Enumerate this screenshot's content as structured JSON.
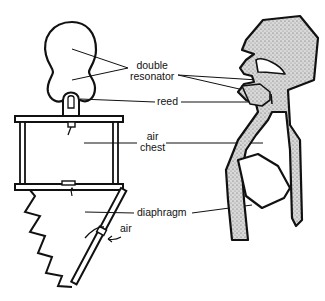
{
  "diagram": {
    "type": "comparison-illustration",
    "left_figure": "mechanical wind instrument model",
    "right_figure": "human vocal tract cross-section",
    "labels": {
      "double_resonator_line1": "double",
      "double_resonator_line2": "resonator",
      "reed": "reed",
      "air_chest_line1": "air",
      "air_chest_line2": "chest",
      "diaphragm": "diaphragm",
      "air": "air"
    },
    "colors": {
      "line": "#111111",
      "stipple": "#9a9a9a",
      "background": "#ffffff"
    }
  }
}
